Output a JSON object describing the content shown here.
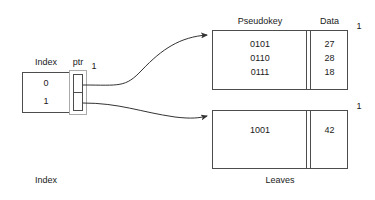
{
  "diagram": {
    "title_index": "Index",
    "title_leaves": "Leaves",
    "index_table": {
      "header_index": "Index",
      "header_ptr": "ptr",
      "rows": [
        {
          "key": "0"
        },
        {
          "key": "1"
        }
      ],
      "ptr_badge": "1"
    },
    "leaves": [
      {
        "header_pseudokey": "Pseudokey",
        "header_data": "Data",
        "depth_badge": "1",
        "rows": [
          {
            "pseudokey": "0101",
            "data": "27"
          },
          {
            "pseudokey": "0110",
            "data": "28"
          },
          {
            "pseudokey": "0111",
            "data": "18"
          }
        ]
      },
      {
        "depth_badge": "1",
        "rows": [
          {
            "pseudokey": "1001",
            "data": "42"
          }
        ]
      }
    ],
    "colors": {
      "stroke": "#4d4d4d",
      "text": "#1a1a1a",
      "background": "#ffffff",
      "arrow": "#333333",
      "ptr_outer": "#999999"
    }
  }
}
